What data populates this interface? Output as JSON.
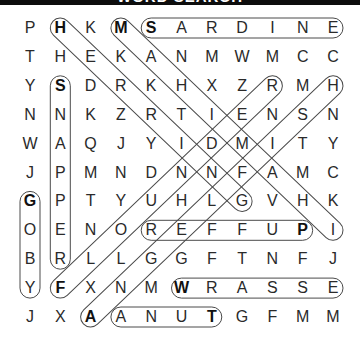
{
  "header": {
    "title": "WORD SEARCH"
  },
  "grid": {
    "rows": 11,
    "cols": 11,
    "letters": [
      [
        "P",
        "H",
        "K",
        "M",
        "S",
        "A",
        "R",
        "D",
        "I",
        "N",
        "E"
      ],
      [
        "T",
        "H",
        "E",
        "K",
        "A",
        "N",
        "M",
        "W",
        "M",
        "C",
        "C"
      ],
      [
        "Y",
        "S",
        "D",
        "R",
        "K",
        "H",
        "X",
        "Z",
        "R",
        "M",
        "H"
      ],
      [
        "N",
        "N",
        "K",
        "Z",
        "R",
        "T",
        "I",
        "E",
        "N",
        "S",
        "N"
      ],
      [
        "W",
        "A",
        "Q",
        "J",
        "Y",
        "I",
        "D",
        "M",
        "I",
        "T",
        "Y"
      ],
      [
        "J",
        "P",
        "M",
        "N",
        "D",
        "N",
        "N",
        "F",
        "A",
        "M",
        "C"
      ],
      [
        "G",
        "P",
        "T",
        "Y",
        "U",
        "H",
        "L",
        "G",
        "V",
        "H",
        "K"
      ],
      [
        "O",
        "E",
        "N",
        "O",
        "R",
        "E",
        "F",
        "F",
        "U",
        "P",
        "I"
      ],
      [
        "B",
        "R",
        "L",
        "L",
        "G",
        "G",
        "F",
        "T",
        "N",
        "F",
        "J"
      ],
      [
        "Y",
        "F",
        "X",
        "N",
        "M",
        "W",
        "R",
        "A",
        "S",
        "S",
        "E"
      ],
      [
        "J",
        "X",
        "A",
        "A",
        "N",
        "U",
        "T",
        "G",
        "F",
        "M",
        "M"
      ]
    ]
  },
  "found_words": [
    {
      "word": "SARDINE",
      "start": [
        0,
        4
      ],
      "end": [
        0,
        10
      ],
      "direction": "right"
    },
    {
      "word": "HERRING",
      "start": [
        0,
        1
      ],
      "end": [
        6,
        7
      ],
      "direction": "down-right"
    },
    {
      "word": "MAHIMAHI",
      "start": [
        0,
        3
      ],
      "end": [
        7,
        10
      ],
      "direction": "down-right"
    },
    {
      "word": "SNAPPER",
      "start": [
        2,
        1
      ],
      "end": [
        8,
        1
      ],
      "direction": "down"
    },
    {
      "word": "GOBY",
      "start": [
        6,
        0
      ],
      "end": [
        9,
        0
      ],
      "direction": "down"
    },
    {
      "word": "PUFFER",
      "start": [
        7,
        9
      ],
      "end": [
        7,
        4
      ],
      "direction": "left"
    },
    {
      "word": "WRASSE",
      "start": [
        9,
        5
      ],
      "end": [
        9,
        10
      ],
      "direction": "right"
    },
    {
      "word": "TUNA",
      "start": [
        10,
        6
      ],
      "end": [
        10,
        3
      ],
      "direction": "left"
    },
    {
      "word": "FLOUNDER",
      "start": [
        9,
        1
      ],
      "end": [
        2,
        8
      ],
      "direction": "up-right"
    },
    {
      "word": "ANGELFISH",
      "start": [
        10,
        2
      ],
      "end": [
        2,
        10
      ],
      "direction": "up-right"
    }
  ],
  "style": {
    "loop_color": "#4a4a4a",
    "letter_color": "#2a2a2a",
    "header_bg": "#0d0d0d"
  }
}
